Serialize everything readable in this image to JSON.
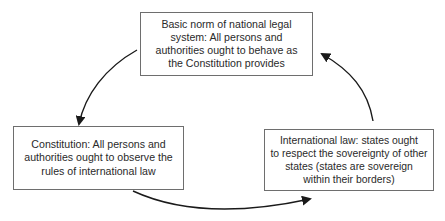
{
  "diagram": {
    "type": "cycle",
    "nodes": [
      {
        "id": "basic-norm",
        "text": "Basic norm of national legal\nsystem: All persons and\nauthorities ought to behave as\nthe Constitution provides"
      },
      {
        "id": "constitution",
        "text": "Constitution: All persons and\nauthorities ought to observe the\nrules of international law"
      },
      {
        "id": "international-law",
        "text": "International law: states ought\nto respect the sovereignty of other\nstates (states are sovereign\nwithin their borders)"
      }
    ],
    "edges": [
      {
        "from": "basic-norm",
        "to": "constitution"
      },
      {
        "from": "constitution",
        "to": "international-law"
      },
      {
        "from": "international-law",
        "to": "basic-norm"
      }
    ],
    "colors": {
      "border": "#6e6e6e",
      "arrow": "#1a1a1a",
      "text": "#2a2a2a",
      "background": "#ffffff"
    }
  }
}
